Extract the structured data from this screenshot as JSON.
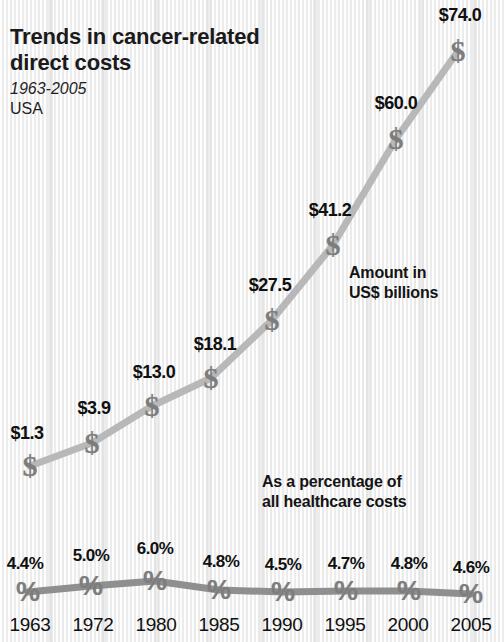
{
  "title": {
    "line1": "Trends in cancer-related",
    "line2": "direct costs",
    "period": "1963-2005",
    "country": "USA"
  },
  "annotations": {
    "amount_line1": "Amount in",
    "amount_line2": "US$ billions",
    "percent_line1": "As a percentage of",
    "percent_line2": "all healthcare costs"
  },
  "markers": {
    "dollar_glyph": "$",
    "percent_glyph": "%"
  },
  "colors": {
    "background": "#f2f2f2",
    "cost_line": "#b8b8b8",
    "percent_line": "#8f8f8f",
    "marker": "#7d7d7d",
    "text": "#101010"
  },
  "chart_data": {
    "type": "line",
    "title": "Trends in cancer-related direct costs",
    "subtitle": "1963-2005 USA",
    "xlabel": "",
    "ylabel": "",
    "grid": false,
    "legend": "inline-annotations",
    "categories": [
      "1963",
      "1972",
      "1980",
      "1985",
      "1990",
      "1995",
      "2000",
      "2005"
    ],
    "series": [
      {
        "name": "Amount in US$ billions",
        "unit": "US$ billions",
        "values": [
          1.3,
          3.9,
          13.0,
          18.1,
          27.5,
          41.2,
          60.0,
          74.0
        ],
        "labels": [
          "$1.3",
          "$3.9",
          "$13.0",
          "$18.1",
          "$27.5",
          "$41.2",
          "$60.0",
          "$74.0"
        ],
        "marker": "$",
        "color": "#b8b8b8"
      },
      {
        "name": "As a percentage of all healthcare costs",
        "unit": "percent",
        "values": [
          4.4,
          5.0,
          6.0,
          4.8,
          4.5,
          4.7,
          4.8,
          4.6
        ],
        "labels": [
          "4.4%",
          "5.0%",
          "6.0%",
          "4.8%",
          "4.5%",
          "4.7%",
          "4.8%",
          "4.6%"
        ],
        "marker": "%",
        "color": "#8f8f8f"
      }
    ],
    "ylim_cost": [
      0,
      80
    ],
    "ylim_percent": [
      0,
      7
    ]
  },
  "geometry": {
    "cost_points": [
      {
        "x": 30,
        "y": 466
      },
      {
        "x": 92,
        "y": 443
      },
      {
        "x": 152,
        "y": 406
      },
      {
        "x": 211,
        "y": 378
      },
      {
        "x": 272,
        "y": 320
      },
      {
        "x": 333,
        "y": 245
      },
      {
        "x": 396,
        "y": 139
      },
      {
        "x": 458,
        "y": 51
      }
    ],
    "cost_label_offsets": [
      {
        "dx": -3,
        "dy": -33
      },
      {
        "dx": 2,
        "dy": -35
      },
      {
        "dx": 2,
        "dy": -34
      },
      {
        "dx": 4,
        "dy": -34
      },
      {
        "dx": -2,
        "dy": -35
      },
      {
        "dx": -3,
        "dy": -35
      },
      {
        "dx": 0,
        "dy": -36
      },
      {
        "dx": 2,
        "dy": -36
      }
    ],
    "pct_points": [
      {
        "x": 28,
        "y": 592
      },
      {
        "x": 91,
        "y": 586
      },
      {
        "x": 155,
        "y": 581
      },
      {
        "x": 219,
        "y": 590
      },
      {
        "x": 283,
        "y": 592
      },
      {
        "x": 346,
        "y": 591
      },
      {
        "x": 409,
        "y": 591
      },
      {
        "x": 471,
        "y": 594
      }
    ],
    "pct_label_offsets": [
      {
        "dx": -3,
        "dy": -28
      },
      {
        "dx": 0,
        "dy": -30
      },
      {
        "dx": 0,
        "dy": -32
      },
      {
        "dx": 2,
        "dy": -28
      },
      {
        "dx": 0,
        "dy": -27
      },
      {
        "dx": 0,
        "dy": -27
      },
      {
        "dx": 0,
        "dy": -27
      },
      {
        "dx": 0,
        "dy": -26
      }
    ],
    "year_positions": [
      30,
      93,
      156,
      219,
      282,
      345,
      408,
      471
    ],
    "year_baseline": 614
  }
}
